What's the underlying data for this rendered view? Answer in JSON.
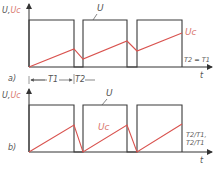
{
  "colors": {
    "square_wave": "#3a3a3a",
    "capacitor_voltage": "#d9534f",
    "label_gray": "#555555",
    "label_red": "#d9776f"
  },
  "panel_a": {
    "label": "a)",
    "y_axis_label_u": "U,",
    "y_axis_label_uc": "Uc",
    "wave_label": "U",
    "curve_label": "Uc",
    "condition": "T2 = T1",
    "x_axis_label": "t",
    "interval_1": "T1",
    "interval_2": "T2"
  },
  "panel_b": {
    "label": "b)",
    "y_axis_label_u": "U,",
    "y_axis_label_uc": "Uc",
    "wave_label": "U",
    "curve_label": "Uc",
    "condition_left": "T2/T1",
    "condition_sep": ",",
    "condition_right": "T2/T1",
    "x_axis_label": "t"
  }
}
